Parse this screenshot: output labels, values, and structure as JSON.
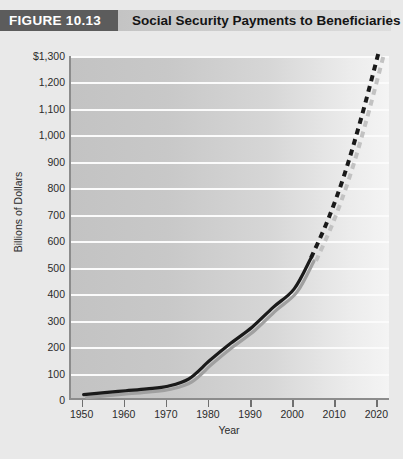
{
  "header": {
    "figure_tag": "FIGURE 10.13",
    "title": "Social Security Payments to Beneficiaries"
  },
  "chart_data": {
    "type": "line",
    "title": "Social Security Payments to Beneficiaries",
    "xlabel": "Year",
    "ylabel": "Billions of Dollars",
    "xlim": [
      1947,
      2023
    ],
    "ylim": [
      0,
      1300
    ],
    "xticks": [
      1950,
      1960,
      1970,
      1980,
      1990,
      2000,
      2010,
      2020
    ],
    "xticklabels": [
      "1950",
      "1960",
      "1970",
      "1980",
      "1990",
      "2000",
      "2010",
      "2020"
    ],
    "yticks": [
      0,
      100,
      200,
      300,
      400,
      500,
      600,
      700,
      800,
      900,
      1000,
      1100,
      1200,
      1300
    ],
    "yticklabels": [
      "0",
      "100",
      "200",
      "300",
      "400",
      "500",
      "600",
      "700",
      "800",
      "900",
      "1,000",
      "1,100",
      "1,200",
      "$1,300"
    ],
    "grid": true,
    "grid_axis": "y",
    "legend": "none",
    "series": [
      {
        "name": "Actual payments",
        "style": "solid",
        "color": "#1a1a1a",
        "x": [
          1950,
          1955,
          1960,
          1965,
          1970,
          1975,
          1980,
          1985,
          1990,
          1995,
          2000,
          2004
        ],
        "values": [
          20,
          28,
          35,
          42,
          52,
          80,
          150,
          215,
          275,
          350,
          420,
          537
        ]
      },
      {
        "name": "Projected payments",
        "style": "dashed",
        "color": "#1a1a1a",
        "x": [
          2004,
          2008,
          2012,
          2016,
          2020
        ],
        "values": [
          537,
          680,
          855,
          1070,
          1310
        ]
      }
    ]
  },
  "axis": {
    "y_title": "Billions of Dollars",
    "x_title": "Year"
  }
}
